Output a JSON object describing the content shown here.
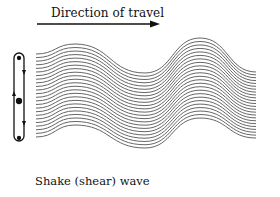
{
  "diagram": {
    "title": "Direction of travel",
    "caption": "Shake (shear) wave",
    "arrow": {
      "direction": "right",
      "color": "#111111"
    },
    "wave": {
      "type": "shear-wave-lines",
      "line_count": 24,
      "line_color": "#555555",
      "top_points": [
        [
          36,
          54
        ],
        [
          75,
          44
        ],
        [
          145,
          73
        ],
        [
          200,
          38
        ],
        [
          256,
          72
        ]
      ],
      "bottom_points": [
        [
          36,
          137
        ],
        [
          75,
          125
        ],
        [
          145,
          148
        ],
        [
          200,
          118
        ],
        [
          256,
          138
        ]
      ]
    },
    "particle_motion": {
      "description": "vertical oscillation loop with arrows up and down",
      "color": "#111111"
    }
  }
}
